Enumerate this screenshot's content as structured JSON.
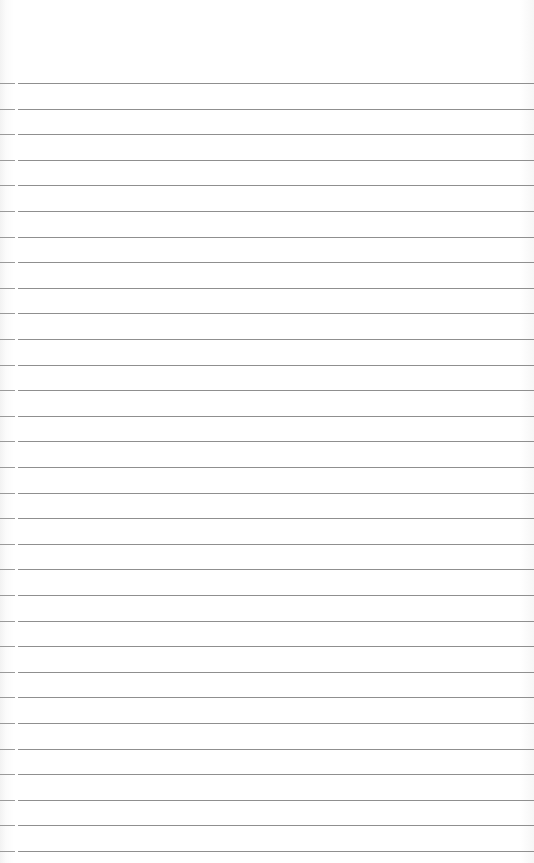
{
  "page": {
    "type": "blank-lined-paper",
    "background_color": "#ffffff",
    "line_color": "#8f8f8f",
    "first_line_y": 83,
    "line_spacing": 25.6,
    "line_count": 31
  }
}
